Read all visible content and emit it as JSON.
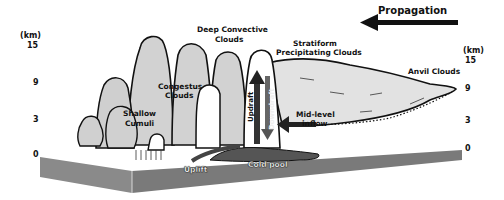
{
  "title": "Propagation",
  "axes": {
    "unit": "(km)",
    "left_ticks": [
      "15",
      "9",
      "3",
      "0"
    ],
    "right_ticks": [
      "15",
      "9",
      "3",
      "0"
    ]
  },
  "clouds": {
    "shallow": [
      "Shallow",
      "Cumuli"
    ],
    "congestus": [
      "Congestus",
      "Clouds"
    ],
    "deep": [
      "Deep Convective",
      "Clouds"
    ],
    "stratiform": [
      "Stratiform",
      "Precipitating Clouds"
    ],
    "anvil": "Anvil Clouds"
  },
  "flows": {
    "updraft": "Updraft",
    "downdraft": "Downdraft",
    "midlevel": [
      "Mid-level",
      "inflow"
    ],
    "uplift": "Uplift",
    "coldpool": "Cold pool"
  },
  "colors": {
    "cloud_fill": "#d4d4d4",
    "cloud_core": "#ffffff",
    "ground": "#7d7d7d",
    "coldpool": "#555555",
    "outline": "#111111"
  }
}
